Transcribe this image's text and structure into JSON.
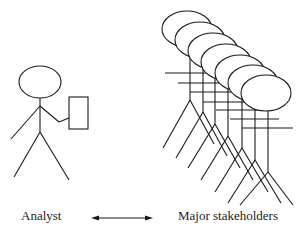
{
  "diagram": {
    "labels": {
      "left": "Analyst",
      "right": "Major stakeholders"
    },
    "nodes": [
      {
        "id": "analyst",
        "type": "stick-figure",
        "holding": "document",
        "count": 1
      },
      {
        "id": "stakeholders",
        "type": "stick-figure-group",
        "count": 6
      }
    ],
    "edges": [
      {
        "from": "analyst",
        "to": "stakeholders",
        "style": "double-headed-arrow"
      }
    ],
    "colors": {
      "stroke": "#1a1a1a",
      "background": "#ffffff"
    }
  }
}
